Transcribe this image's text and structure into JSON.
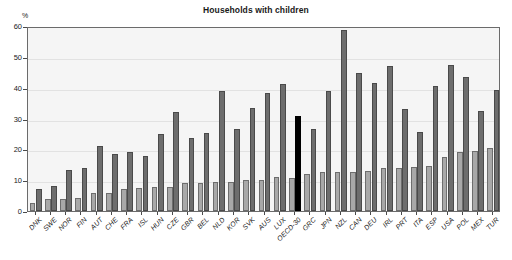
{
  "chart": {
    "title": "Households with children",
    "ylabel": "%"
  },
  "chart_data": {
    "type": "bar",
    "title": "Households with children",
    "xlabel": "",
    "ylabel": "%",
    "ylim": [
      0,
      60
    ],
    "yticks": [
      0,
      10,
      20,
      30,
      40,
      50,
      60
    ],
    "grid": true,
    "legend_position": "none",
    "categories": [
      "DNK",
      "SWE",
      "NOR",
      "FIN",
      "AUT",
      "CHE",
      "FRA",
      "ISL",
      "HUN",
      "CZE",
      "GBR",
      "BEL",
      "NLD",
      "KOR",
      "SVK",
      "AUS",
      "LUX",
      "OECD-30",
      "GRC",
      "JPN",
      "NZL",
      "CAN",
      "DEU",
      "IRL",
      "PRT",
      "ITA",
      "ESP",
      "USA",
      "POL",
      "MEX",
      "TUR"
    ],
    "series": [
      {
        "name": "light-grey-bar",
        "color": "#a8a8a8",
        "values": [
          2.5,
          3.8,
          3.9,
          4.1,
          5.7,
          5.9,
          7.1,
          7.5,
          7.9,
          7.9,
          9.1,
          9.1,
          9.4,
          9.4,
          10.0,
          10.2,
          11.0,
          10.7,
          12.0,
          12.5,
          12.5,
          12.7,
          13.1,
          13.8,
          14.0,
          14.3,
          14.6,
          17.6,
          19.1,
          19.5,
          20.3
        ]
      },
      {
        "name": "dark-grey-bar",
        "color": "#6d6d6d",
        "values": [
          7.0,
          8.2,
          13.3,
          13.8,
          21.1,
          18.6,
          19.3,
          18.0,
          25.1,
          32.0,
          23.7,
          25.2,
          39.0,
          26.7,
          33.4,
          38.2,
          41.2,
          null,
          26.5,
          39.0,
          58.8,
          44.7,
          41.4,
          46.9,
          33.2,
          25.5,
          40.5,
          47.4,
          43.4,
          32.5,
          39.2
        ]
      },
      {
        "name": "oecd-average-bar",
        "color": "#000000",
        "values": [
          null,
          null,
          null,
          null,
          null,
          null,
          null,
          null,
          null,
          null,
          null,
          null,
          null,
          null,
          null,
          null,
          null,
          30.8,
          null,
          null,
          null,
          null,
          null,
          null,
          null,
          null,
          null,
          null,
          null,
          null,
          null
        ]
      }
    ]
  }
}
